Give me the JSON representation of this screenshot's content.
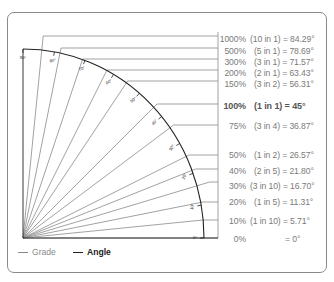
{
  "diagram": {
    "type": "slope-grade-angle-chart",
    "rows": [
      {
        "grade": "1000%",
        "ratio": "(10 in 1)",
        "angle_text": "= 84.29°",
        "angle": 84.29,
        "y": 36,
        "label_y": 34,
        "bold": false
      },
      {
        "grade": "500%",
        "ratio": "(5 in 1)",
        "angle_text": "= 78.69°",
        "angle": 78.69,
        "y": 48,
        "label_y": 46,
        "bold": false
      },
      {
        "grade": "300%",
        "ratio": "(3 in 1)",
        "angle_text": "= 71.57°",
        "angle": 71.57,
        "y": 59,
        "label_y": 57,
        "bold": false
      },
      {
        "grade": "200%",
        "ratio": "(2 in 1)",
        "angle_text": "= 63.43°",
        "angle": 63.43,
        "y": 70,
        "label_y": 68,
        "bold": false
      },
      {
        "grade": "150%",
        "ratio": "(3 in 2)",
        "angle_text": "= 56.31°",
        "angle": 56.31,
        "y": 81,
        "label_y": 79,
        "bold": false
      },
      {
        "grade": "100%",
        "ratio": "(1 in 1)",
        "angle_text": "= 45°",
        "angle": 45,
        "y": 104,
        "label_y": 101,
        "bold": true
      },
      {
        "grade": "75%",
        "ratio": "(3 in 4)",
        "angle_text": "= 36.87°",
        "angle": 36.87,
        "y": 125,
        "label_y": 121,
        "bold": false
      },
      {
        "grade": "50%",
        "ratio": "(1 in 2)",
        "angle_text": "= 26.57°",
        "angle": 26.57,
        "y": 155,
        "label_y": 150,
        "bold": false
      },
      {
        "grade": "40%",
        "ratio": "(2 in 5)",
        "angle_text": "= 21.80°",
        "angle": 21.8,
        "y": 169,
        "label_y": 166,
        "bold": false
      },
      {
        "grade": "30%",
        "ratio": "(3 in 10)",
        "angle_text": "= 16.70°",
        "angle": 16.7,
        "y": 182,
        "label_y": 181,
        "bold": false
      },
      {
        "grade": "20%",
        "ratio": "(1 in 5)",
        "angle_text": "= 11.31°",
        "angle": 11.31,
        "y": 202,
        "label_y": 197,
        "bold": false
      },
      {
        "grade": "10%",
        "ratio": "(1 in 10)",
        "angle_text": "= 5.71°",
        "angle": 5.71,
        "y": 220,
        "label_y": 216,
        "bold": false
      },
      {
        "grade": "0%",
        "ratio": "",
        "angle_text": "= 0°",
        "angle": 0,
        "y": 238,
        "label_y": 234,
        "bold": false
      }
    ],
    "arc_ticks": [
      "0°",
      "10°",
      "20°",
      "30°",
      "40°",
      "50°",
      "60°",
      "70°",
      "80°",
      "90°"
    ],
    "legend": {
      "grade_label": "Grade",
      "angle_label": "Angle",
      "grade_color": "#8a8a8a",
      "angle_color": "#222222"
    }
  }
}
